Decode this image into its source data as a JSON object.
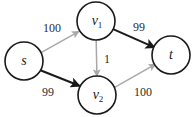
{
  "diagram": {
    "background_color": "#ffffff",
    "node_stroke_color": "#1a1a1a",
    "edge_colors": {
      "dark": "#1a1a1a",
      "light": "#a8a8a8"
    },
    "nodes": [
      {
        "id": "s",
        "label": "s",
        "sub": "",
        "cx": 24,
        "cy": 61,
        "r": 19
      },
      {
        "id": "v1",
        "label": "v",
        "sub": "1",
        "cx": 96,
        "cy": 21,
        "r": 19
      },
      {
        "id": "v2",
        "label": "v",
        "sub": "2",
        "cx": 97,
        "cy": 95,
        "r": 19
      },
      {
        "id": "t",
        "label": "t",
        "sub": "",
        "cx": 171,
        "cy": 55,
        "r": 19
      }
    ],
    "edges": [
      {
        "id": "s-v1",
        "from": "s",
        "to": "v1",
        "capacity": "100",
        "color": "light",
        "label_x": 52,
        "label_y": 28
      },
      {
        "id": "s-v2",
        "from": "s",
        "to": "v2",
        "capacity": "99",
        "color": "dark",
        "label_x": 48,
        "label_y": 92
      },
      {
        "id": "v1-v2",
        "from": "v1",
        "to": "v2",
        "capacity": "1",
        "color": "light",
        "label_x": 107,
        "label_y": 59
      },
      {
        "id": "v1-t",
        "from": "v1",
        "to": "t",
        "capacity": "99",
        "color": "dark",
        "label_x": 139,
        "label_y": 27
      },
      {
        "id": "v2-t",
        "from": "v2",
        "to": "t",
        "capacity": "100",
        "color": "light",
        "label_x": 143,
        "label_y": 92
      }
    ]
  }
}
